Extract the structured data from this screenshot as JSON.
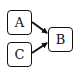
{
  "diagram": {
    "type": "directed-graph",
    "nodes": [
      {
        "id": "A",
        "label": "A"
      },
      {
        "id": "B",
        "label": "B"
      },
      {
        "id": "C",
        "label": "C"
      }
    ],
    "edges": [
      {
        "from": "A",
        "to": "B"
      },
      {
        "from": "C",
        "to": "B"
      }
    ],
    "colors": {
      "stroke": "#111111",
      "background": "#ffffff"
    }
  }
}
